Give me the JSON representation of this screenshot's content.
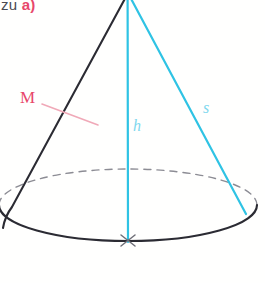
{
  "figure": {
    "kind": "cone-geometry-sketch",
    "width": 265,
    "height": 283,
    "background": "#fffffe",
    "heading": {
      "prefix": "zu ",
      "accent": "a)",
      "prefix_color": "#4a4a52",
      "accent_color": "#e8476b"
    },
    "labels": {
      "lateral_surface": "M",
      "height": "h",
      "slant": "s"
    },
    "colors": {
      "outline": "#2b2b33",
      "hidden_edge": "#8c8c94",
      "cyan": "#2fc3e4",
      "pink": "#e8476b",
      "pink_light": "#f0a9b8",
      "center_mark": "#6f6f78"
    },
    "geometry": {
      "apex": {
        "x": 127.5,
        "y": -4
      },
      "base_center": {
        "x": 128,
        "y": 241
      },
      "base_rx": 129,
      "base_ry": 36,
      "slant_right_end": {
        "x": 246,
        "y": 213
      },
      "slant_left_end": {
        "x": 10,
        "y": 214
      },
      "tick_start": {
        "x": 42,
        "y": 104
      },
      "tick_end": {
        "x": 98,
        "y": 125
      }
    }
  }
}
